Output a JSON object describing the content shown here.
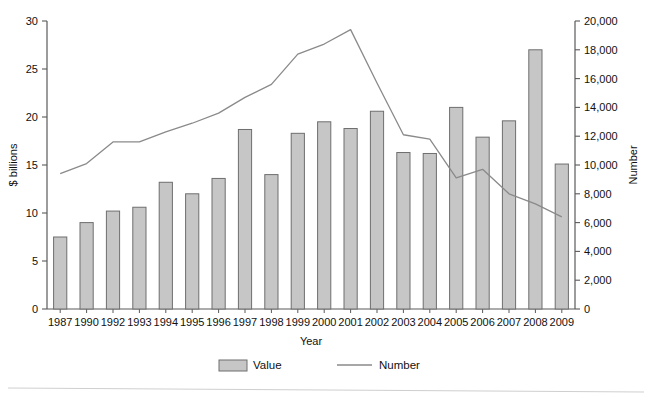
{
  "chart_data": {
    "type": "bar",
    "title": "",
    "subtitle": "",
    "xlabel": "Year",
    "ylabel": "$ billions",
    "y2label": "Number",
    "categories": [
      "1987",
      "1990",
      "1992",
      "1993",
      "1994",
      "1995",
      "1996",
      "1997",
      "1998",
      "1999",
      "2000",
      "2001",
      "2002",
      "2003",
      "2004",
      "2005",
      "2006",
      "2007",
      "2008",
      "2009"
    ],
    "grid": false,
    "legend_position": "bottom",
    "ylim": [
      0,
      30
    ],
    "yticks": [
      0,
      5,
      10,
      15,
      20,
      25,
      30
    ],
    "ytick_labels": [
      "0",
      "5",
      "10",
      "15",
      "20",
      "25",
      "30"
    ],
    "y2lim": [
      0,
      20000
    ],
    "y2ticks": [
      0,
      2000,
      4000,
      6000,
      8000,
      10000,
      12000,
      14000,
      16000,
      18000,
      20000
    ],
    "y2tick_labels": [
      "0",
      "2,000",
      "4,000",
      "6,000",
      "8,000",
      "10,000",
      "12,000",
      "14,000",
      "16,000",
      "18,000",
      "20,000"
    ],
    "series": [
      {
        "name": "Value",
        "type": "bar",
        "axis": "left",
        "color": "#c6c6c6",
        "edge_color": "#6e6e6e",
        "values": [
          7.5,
          9.0,
          10.2,
          10.6,
          13.2,
          12.0,
          13.6,
          18.7,
          14.0,
          18.3,
          19.5,
          18.8,
          20.6,
          16.3,
          16.2,
          21.0,
          17.9,
          19.6,
          27.0,
          15.1
        ]
      },
      {
        "name": "Number",
        "type": "line",
        "axis": "right",
        "color": "#8a8a8a",
        "values": [
          9400,
          10100,
          11600,
          11600,
          12300,
          12900,
          13600,
          14700,
          15600,
          17700,
          18400,
          19400,
          15700,
          12100,
          11800,
          9100,
          9700,
          8000,
          7300,
          6400
        ]
      }
    ],
    "legend": [
      {
        "label": "Value",
        "marker": "bar-swatch"
      },
      {
        "label": "Number",
        "marker": "line-swatch"
      }
    ]
  },
  "axes": {
    "left_title": "$ billions",
    "right_title": "Number",
    "x_title": "Year"
  },
  "colors": {
    "bar_fill": "#c6c6c6",
    "bar_edge": "#6e6e6e",
    "line": "#8a8a8a",
    "axis": "#5a5a5a",
    "text": "#111111",
    "rule": "#cfcfcf"
  }
}
